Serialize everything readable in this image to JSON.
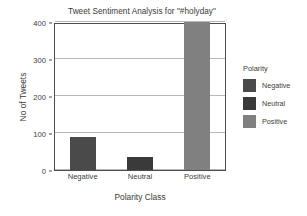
{
  "chart_data": {
    "type": "bar",
    "title": "Tweet Sentiment Analysis for \"#holyday\"",
    "xlabel": "Polarity Class",
    "ylabel": "No of Tweets",
    "categories": [
      "Negative",
      "Neutral",
      "Positive"
    ],
    "values": [
      88,
      35,
      400
    ],
    "colors": [
      "#4a4a4a",
      "#3a3a3a",
      "#808080"
    ],
    "ylim": [
      0,
      400
    ],
    "yticks": [
      0,
      100,
      200,
      300,
      400
    ],
    "grid": true,
    "legend": {
      "title": "Polarity",
      "position": "right",
      "entries": [
        {
          "label": "Negative",
          "color": "#4a4a4a"
        },
        {
          "label": "Neutral",
          "color": "#3a3a3a"
        },
        {
          "label": "Positive",
          "color": "#808080"
        }
      ]
    }
  }
}
